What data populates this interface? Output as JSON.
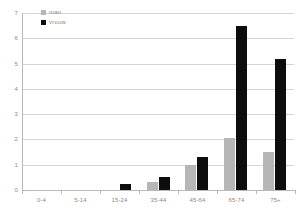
{
  "chart_data": {
    "type": "bar",
    "title": "",
    "xlabel": "",
    "ylabel": "",
    "ylim": [
      0,
      7
    ],
    "yticks": [
      "0",
      "1",
      "2",
      "3",
      "4",
      "5",
      "6",
      "7"
    ],
    "grid": true,
    "legend_position": "top-left",
    "categories": [
      "0-4",
      "5-14",
      "15-24",
      "35-44",
      "45-64",
      "65-74",
      "75+"
    ],
    "series": [
      {
        "name": "man",
        "color": "#b6b6b6",
        "values": [
          0,
          0,
          0,
          0.3,
          1.0,
          2.05,
          1.5
        ]
      },
      {
        "name": "vrouw",
        "color": "#0d0d0d",
        "values": [
          0,
          0,
          0.25,
          0.5,
          1.3,
          6.5,
          5.2
        ]
      }
    ]
  },
  "legend": {
    "items": [
      {
        "label": "man",
        "swatch": "man"
      },
      {
        "label": "vrouw",
        "swatch": "vrouw"
      }
    ]
  },
  "colors": {
    "man": "#b6b6b6",
    "vrouw": "#0d0d0d",
    "grid": "#d4d4d4",
    "axis": "#b9b9b9",
    "text": "#8a8a8a",
    "background": "#ffffff"
  }
}
